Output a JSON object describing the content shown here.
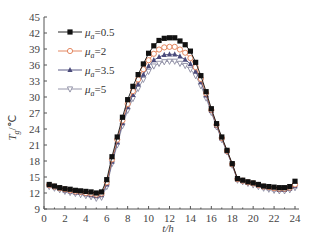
{
  "chart_data": {
    "type": "line",
    "title": "",
    "xlabel": "t/h",
    "ylabel": "T_g/℃",
    "xlim": [
      0,
      24
    ],
    "ylim": [
      9,
      45
    ],
    "xticks": [
      0,
      2,
      4,
      6,
      8,
      10,
      12,
      14,
      16,
      18,
      20,
      22,
      24
    ],
    "yticks": [
      9,
      12,
      15,
      18,
      21,
      24,
      27,
      30,
      33,
      36,
      39,
      42,
      45
    ],
    "grid": false,
    "legend_position": "upper-left",
    "x": [
      0.5,
      1,
      1.5,
      2,
      2.5,
      3,
      3.5,
      4,
      4.5,
      5,
      5.5,
      6,
      6.5,
      7,
      7.5,
      8,
      8.5,
      9,
      9.5,
      10,
      10.5,
      11,
      11.5,
      12,
      12.5,
      13,
      13.5,
      14,
      14.5,
      15,
      15.5,
      16,
      16.5,
      17,
      17.5,
      18,
      18.5,
      19,
      19.5,
      20,
      20.5,
      21,
      21.5,
      22,
      22.5,
      23,
      23.5,
      24
    ],
    "series": [
      {
        "name": "μa=0.5",
        "marker": "filled-square",
        "color": "#111111",
        "values": [
          13.6,
          13.3,
          13.0,
          12.8,
          12.7,
          12.5,
          12.4,
          12.3,
          12.2,
          12.0,
          12.2,
          14.5,
          18.8,
          22.5,
          26.2,
          29.5,
          32.0,
          34.2,
          36.2,
          38.2,
          39.6,
          40.6,
          41.0,
          41.1,
          41.1,
          40.5,
          39.8,
          38.6,
          36.5,
          34.0,
          31.0,
          27.8,
          25.0,
          22.5,
          20.0,
          17.5,
          14.7,
          14.4,
          14.1,
          13.9,
          13.6,
          13.3,
          13.2,
          13.1,
          13.0,
          13.0,
          13.2,
          14.2
        ]
      },
      {
        "name": "μa=2",
        "marker": "open-circle",
        "color": "#e07a50",
        "values": [
          13.5,
          13.2,
          12.9,
          12.7,
          12.5,
          12.3,
          12.2,
          12.0,
          11.9,
          11.7,
          11.9,
          14.0,
          18.3,
          22.0,
          25.6,
          28.7,
          31.1,
          33.3,
          35.2,
          36.9,
          38.1,
          38.9,
          39.3,
          39.4,
          39.4,
          38.9,
          38.3,
          37.3,
          35.6,
          33.4,
          30.7,
          27.6,
          24.8,
          22.3,
          19.9,
          17.4,
          14.6,
          14.3,
          14.0,
          13.8,
          13.5,
          13.2,
          13.1,
          12.9,
          12.8,
          12.8,
          13.0,
          13.6
        ]
      },
      {
        "name": "μa=3.5",
        "marker": "filled-triangle",
        "color": "#4a4a7a",
        "values": [
          13.4,
          13.1,
          12.8,
          12.5,
          12.3,
          12.1,
          12.0,
          11.8,
          11.6,
          11.4,
          11.6,
          13.6,
          17.9,
          21.5,
          25.1,
          28.1,
          30.4,
          32.4,
          34.2,
          35.8,
          36.9,
          37.5,
          37.9,
          38.0,
          38.0,
          37.6,
          37.0,
          36.2,
          34.8,
          32.8,
          30.3,
          27.4,
          24.6,
          22.2,
          19.8,
          17.3,
          14.5,
          14.2,
          13.9,
          13.7,
          13.4,
          13.1,
          12.9,
          12.7,
          12.6,
          12.6,
          12.8,
          13.3
        ]
      },
      {
        "name": "μa=5",
        "marker": "open-triangle-down",
        "color": "#8a8aa0",
        "values": [
          13.2,
          12.9,
          12.6,
          12.3,
          12.1,
          11.9,
          11.7,
          11.5,
          11.3,
          11.0,
          11.2,
          13.2,
          17.5,
          21.0,
          24.6,
          27.5,
          29.7,
          31.6,
          33.3,
          34.8,
          35.8,
          36.3,
          36.6,
          36.7,
          36.7,
          36.3,
          35.9,
          35.2,
          34.0,
          32.1,
          29.8,
          27.1,
          24.4,
          22.0,
          19.7,
          17.2,
          14.4,
          14.1,
          13.8,
          13.5,
          13.2,
          12.9,
          12.7,
          12.5,
          12.4,
          12.4,
          12.6,
          13.0
        ]
      }
    ]
  },
  "axes": {
    "xlabel": "t/h",
    "ylabel_main": "T",
    "ylabel_sub": "g",
    "ylabel_unit": "/℃"
  },
  "legend": [
    {
      "label_sym": "μ",
      "label_sub": "a",
      "label_val": "=0.5"
    },
    {
      "label_sym": "μ",
      "label_sub": "a",
      "label_val": "=2"
    },
    {
      "label_sym": "μ",
      "label_sub": "a",
      "label_val": "=3.5"
    },
    {
      "label_sym": "μ",
      "label_sub": "a",
      "label_val": "=5"
    }
  ]
}
